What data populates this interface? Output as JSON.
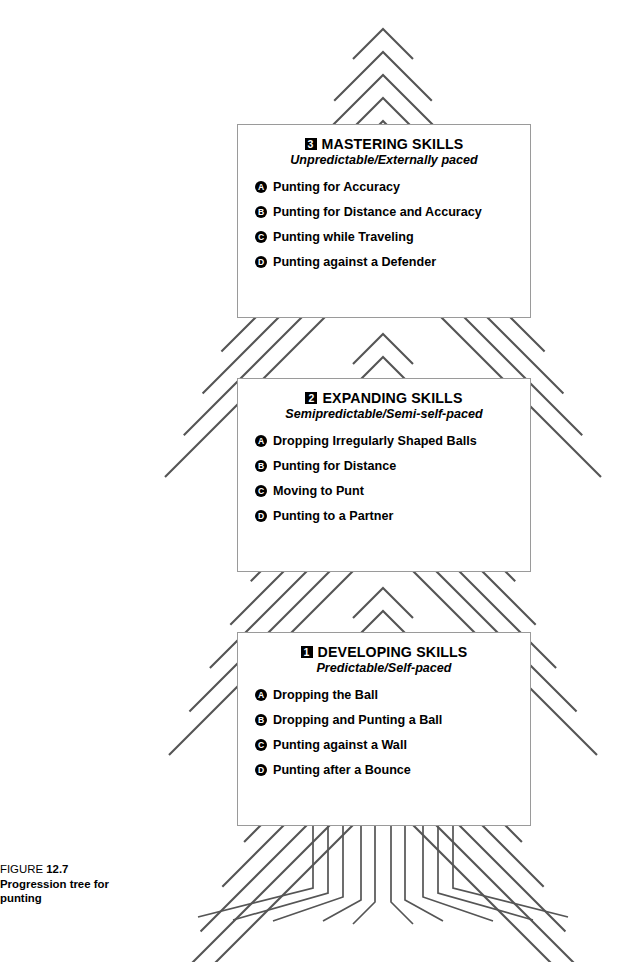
{
  "figure": {
    "caption_lead": "FIGURE",
    "caption_number": "12.7",
    "caption_text": "Progression tree for punting",
    "line_color": "#555555",
    "box_border_color": "#9a9a9a",
    "badge_color": "#000000"
  },
  "tiers": [
    {
      "number": "3",
      "title": "MASTERING SKILLS",
      "subtitle": "Unpredictable/Externally paced",
      "items": [
        {
          "marker": "A",
          "label": "Punting for Accuracy"
        },
        {
          "marker": "B",
          "label": "Punting for Distance and Accuracy"
        },
        {
          "marker": "C",
          "label": "Punting while Traveling"
        },
        {
          "marker": "D",
          "label": "Punting against a Defender"
        }
      ]
    },
    {
      "number": "2",
      "title": "EXPANDING SKILLS",
      "subtitle": "Semipredictable/Semi-self-paced",
      "items": [
        {
          "marker": "A",
          "label": "Dropping Irregularly Shaped Balls"
        },
        {
          "marker": "B",
          "label": "Punting for Distance"
        },
        {
          "marker": "C",
          "label": "Moving to Punt"
        },
        {
          "marker": "D",
          "label": "Punting to a Partner"
        }
      ]
    },
    {
      "number": "1",
      "title": "DEVELOPING SKILLS",
      "subtitle": "Predictable/Self-paced",
      "items": [
        {
          "marker": "A",
          "label": "Dropping the Ball"
        },
        {
          "marker": "B",
          "label": "Dropping and Punting a Ball"
        },
        {
          "marker": "C",
          "label": "Punting against a Wall"
        },
        {
          "marker": "D",
          "label": "Punting after a Bounce"
        }
      ]
    }
  ]
}
